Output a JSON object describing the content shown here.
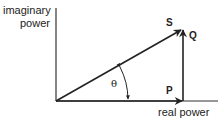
{
  "diagram": {
    "type": "power-triangle",
    "axes": {
      "y_label_line1": "imaginary",
      "y_label_line2": "power",
      "x_label": "real power"
    },
    "vectors": {
      "S": "S",
      "Q": "Q",
      "P": "P"
    },
    "angle_label": "θ",
    "colors": {
      "line": "#222222",
      "background": "#ffffff"
    }
  }
}
